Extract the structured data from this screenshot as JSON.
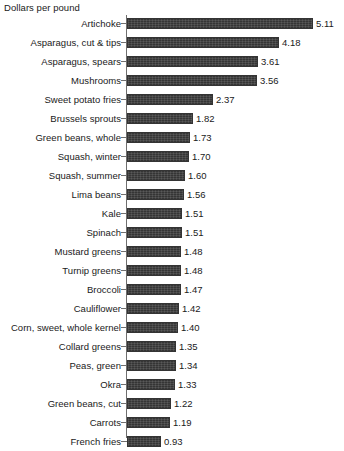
{
  "chart_data": {
    "type": "bar",
    "orientation": "horizontal",
    "title": "",
    "xlabel": "Dollars per pound",
    "ylabel": "",
    "axis_title": "Dollars per pound",
    "grid": false,
    "legend": null,
    "xlim": [
      0,
      5.4
    ],
    "value_format": "2 decimal places",
    "categories": [
      "Artichoke",
      "Asparagus, cut & tips",
      "Asparagus, spears",
      "Mushrooms",
      "Sweet potato fries",
      "Brussels sprouts",
      "Green beans, whole",
      "Squash, winter",
      "Squash, summer",
      "Lima beans",
      "Kale",
      "Spinach",
      "Mustard greens",
      "Turnip greens",
      "Broccoli",
      "Cauliflower",
      "Corn, sweet, whole kernel",
      "Collard greens",
      "Peas, green",
      "Okra",
      "Green beans, cut",
      "Carrots",
      "French fries"
    ],
    "values": [
      5.11,
      4.18,
      3.61,
      3.56,
      2.37,
      1.82,
      1.73,
      1.7,
      1.6,
      1.56,
      1.51,
      1.51,
      1.48,
      1.48,
      1.47,
      1.42,
      1.4,
      1.35,
      1.34,
      1.33,
      1.22,
      1.19,
      0.93
    ],
    "value_labels": [
      "5.11",
      "4.18",
      "3.61",
      "3.56",
      "2.37",
      "1.82",
      "1.73",
      "1.70",
      "1.60",
      "1.56",
      "1.51",
      "1.51",
      "1.48",
      "1.48",
      "1.47",
      "1.42",
      "1.40",
      "1.35",
      "1.34",
      "1.33",
      "1.22",
      "1.19",
      "0.93"
    ],
    "colors": {
      "bar_fill": "#3f3f3f",
      "bar_edge": "#343434",
      "axis": "#6f6f6f",
      "text": "#1a1a1a",
      "background": "#ffffff"
    }
  }
}
